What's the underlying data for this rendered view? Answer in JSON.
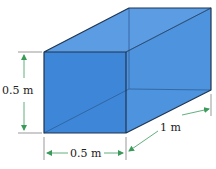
{
  "diagram": {
    "type": "rectangular-box-dimensions",
    "colors": {
      "front_face": "#3d86d8",
      "top_face": "#5b9ce3",
      "side_face": "#4e93dd",
      "edge": "#1f3550",
      "hidden_edge": "#2d5e99",
      "dimension_line": "#3a9a5a"
    },
    "dimensions": {
      "height": "0.5 m",
      "width": "0.5 m",
      "length": "1 m"
    }
  }
}
